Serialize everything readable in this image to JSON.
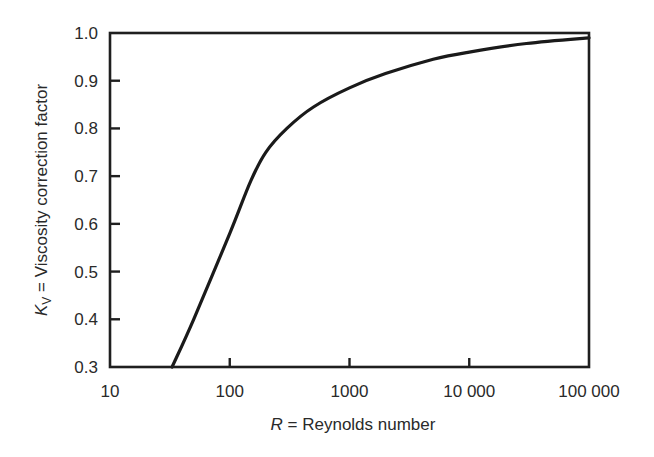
{
  "chart_data": {
    "type": "line",
    "title": "",
    "xlabel": "R = Reynolds number",
    "xlabel_var": "R",
    "xlabel_text": " = Reynolds number",
    "ylabel": "K_V = Viscosity correction factor",
    "ylabel_var": "K",
    "ylabel_sub": "V",
    "ylabel_text": " = Viscosity correction factor",
    "xscale": "log",
    "xlim": [
      10,
      100000
    ],
    "ylim": [
      0.3,
      1.0
    ],
    "grid": false,
    "legend": null,
    "x_ticks": [
      {
        "value": 10,
        "label": "10"
      },
      {
        "value": 100,
        "label": "100"
      },
      {
        "value": 1000,
        "label": "1000"
      },
      {
        "value": 10000,
        "label": "10 000"
      },
      {
        "value": 100000,
        "label": "100 000"
      }
    ],
    "y_ticks": [
      {
        "value": 0.3,
        "label": "0.3"
      },
      {
        "value": 0.4,
        "label": "0.4"
      },
      {
        "value": 0.5,
        "label": "0.5"
      },
      {
        "value": 0.6,
        "label": "0.6"
      },
      {
        "value": 0.7,
        "label": "0.7"
      },
      {
        "value": 0.8,
        "label": "0.8"
      },
      {
        "value": 0.9,
        "label": "0.9"
      },
      {
        "value": 1.0,
        "label": "1.0"
      }
    ],
    "series": [
      {
        "name": "K_V",
        "color": "#1a1a1a",
        "x": [
          33,
          50,
          100,
          150,
          200,
          300,
          500,
          1000,
          2000,
          5000,
          10000,
          30000,
          100000
        ],
        "y": [
          0.3,
          0.4,
          0.58,
          0.69,
          0.75,
          0.8,
          0.845,
          0.885,
          0.915,
          0.945,
          0.96,
          0.978,
          0.99
        ]
      }
    ]
  }
}
